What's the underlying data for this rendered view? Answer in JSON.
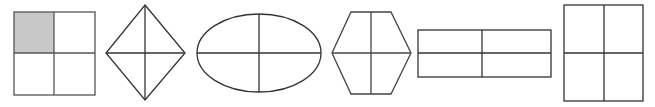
{
  "diagram": {
    "colors": {
      "stroke": "#333333",
      "shade": "#c8c8c8",
      "background": "#ffffff"
    },
    "shapes": [
      {
        "id": "square",
        "kind": "square",
        "parts": 4,
        "shaded_parts": 1,
        "shaded_region": "top-left"
      },
      {
        "id": "rhombus",
        "kind": "rhombus",
        "parts": 4,
        "shaded_parts": 0
      },
      {
        "id": "ellipse",
        "kind": "ellipse",
        "parts": 4,
        "shaded_parts": 0
      },
      {
        "id": "hexagon",
        "kind": "hexagon",
        "parts": 4,
        "shaded_parts": 0
      },
      {
        "id": "wide-rectangle",
        "kind": "rectangle",
        "orientation": "horizontal",
        "parts": 4,
        "shaded_parts": 0
      },
      {
        "id": "tall-rectangle",
        "kind": "rectangle",
        "orientation": "vertical",
        "parts": 4,
        "shaded_parts": 0
      }
    ]
  }
}
